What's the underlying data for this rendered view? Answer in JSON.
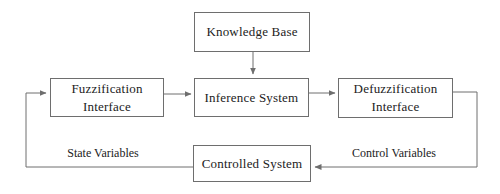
{
  "diagram": {
    "colors": {
      "background": "#ffffff",
      "line": "#6e6e6e",
      "text": "#222222"
    },
    "boxes": {
      "knowledge_base": {
        "label": "Knowledge Base"
      },
      "fuzzification": {
        "label_line1": "Fuzzification",
        "label_line2": "Interface"
      },
      "inference": {
        "label": "Inference System"
      },
      "defuzzification": {
        "label_line1": "Defuzzification",
        "label_line2": "Interface"
      },
      "controlled_system": {
        "label": "Controlled System"
      }
    },
    "edge_labels": {
      "state_variables": "State Variables",
      "control_variables": "Control Variables"
    },
    "connections": [
      {
        "from": "Knowledge Base",
        "to": "Inference System",
        "label": ""
      },
      {
        "from": "Fuzzification Interface",
        "to": "Inference System",
        "label": ""
      },
      {
        "from": "Inference System",
        "to": "Defuzzification Interface",
        "label": ""
      },
      {
        "from": "Defuzzification Interface",
        "to": "Controlled System",
        "label": "Control Variables"
      },
      {
        "from": "Controlled System",
        "to": "Fuzzification Interface",
        "label": "State Variables"
      }
    ]
  }
}
